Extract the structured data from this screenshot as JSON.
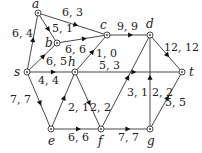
{
  "diagram": {
    "type": "flow-network",
    "nodes": [
      {
        "id": "a",
        "label": "a",
        "x": 38,
        "y": 13,
        "lx": 32,
        "ly": 8
      },
      {
        "id": "b",
        "label": "b",
        "x": 57,
        "y": 43,
        "lx": 45,
        "ly": 47
      },
      {
        "id": "c",
        "label": "c",
        "x": 107,
        "y": 35,
        "lx": 100,
        "ly": 29
      },
      {
        "id": "d",
        "label": "d",
        "x": 150,
        "y": 35,
        "lx": 146,
        "ly": 28
      },
      {
        "id": "s",
        "label": "s",
        "x": 27,
        "y": 72,
        "lx": 14,
        "ly": 76
      },
      {
        "id": "h",
        "label": "h",
        "x": 75,
        "y": 72,
        "lx": 68,
        "ly": 66
      },
      {
        "id": "t",
        "label": "t",
        "x": 182,
        "y": 72,
        "lx": 189,
        "ly": 76
      },
      {
        "id": "e",
        "label": "e",
        "x": 51,
        "y": 129,
        "lx": 48,
        "ly": 145
      },
      {
        "id": "f",
        "label": "f",
        "x": 101,
        "y": 129,
        "lx": 98,
        "ly": 145
      },
      {
        "id": "g",
        "label": "g",
        "x": 150,
        "y": 129,
        "lx": 147,
        "ly": 145
      }
    ],
    "edges": [
      {
        "from": "s",
        "to": "a",
        "label": "6, 4",
        "lx": 12,
        "ly": 37
      },
      {
        "from": "a",
        "to": "c",
        "label": "6, 3",
        "lx": 62,
        "ly": 16
      },
      {
        "from": "a",
        "to": "b",
        "label": "5, 1",
        "lx": 52,
        "ly": 32
      },
      {
        "from": "b",
        "to": "c",
        "label": "6, 6",
        "lx": 65,
        "ly": 53
      },
      {
        "from": "s",
        "to": "b",
        "label": "6, 5",
        "lx": 46,
        "ly": 65
      },
      {
        "from": "c",
        "to": "d",
        "label": "9, 9",
        "lx": 117,
        "ly": 30
      },
      {
        "from": "h",
        "to": "c",
        "label": "1, 0",
        "lx": 96,
        "ly": 57
      },
      {
        "from": "d",
        "to": "t",
        "label": "12, 12",
        "lx": 164,
        "ly": 51
      },
      {
        "from": "s",
        "to": "h",
        "label": "4, 4",
        "lx": 38,
        "ly": 84
      },
      {
        "from": "h",
        "to": "t",
        "label": "5, 3",
        "lx": 99,
        "ly": 69
      },
      {
        "from": "s",
        "to": "e",
        "label": "7, 7",
        "lx": 10,
        "ly": 103
      },
      {
        "from": "e",
        "to": "h",
        "label": "2, 1",
        "lx": 68,
        "ly": 111
      },
      {
        "from": "h",
        "to": "f",
        "label": "2, 2",
        "lx": 90,
        "ly": 111
      },
      {
        "from": "f",
        "to": "d",
        "label": "3, 1",
        "lx": 127,
        "ly": 96
      },
      {
        "from": "g",
        "to": "d",
        "label": "2, 2",
        "lx": 152,
        "ly": 96
      },
      {
        "from": "g",
        "to": "t",
        "label": "5, 5",
        "lx": 165,
        "ly": 106
      },
      {
        "from": "e",
        "to": "f",
        "label": "6, 6",
        "lx": 68,
        "ly": 141
      },
      {
        "from": "f",
        "to": "g",
        "label": "7, 7",
        "lx": 118,
        "ly": 141
      }
    ]
  }
}
